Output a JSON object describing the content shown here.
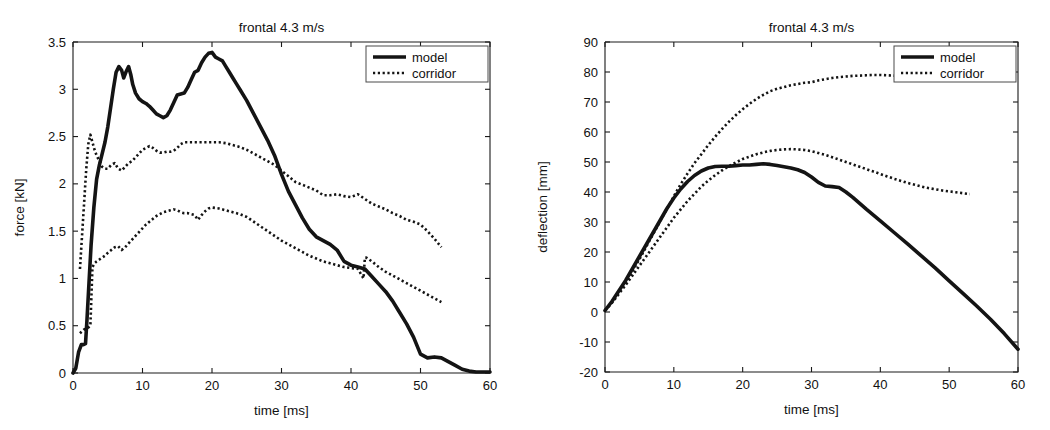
{
  "figure": {
    "background": "#ffffff",
    "line_color": "#141414",
    "panels": [
      "force-vs-time",
      "deflection-vs-time"
    ]
  },
  "chart_data": [
    {
      "id": "force-vs-time",
      "type": "line",
      "title": "frontal 4.3 m/s",
      "xlabel": "time [ms]",
      "ylabel": "force [kN]",
      "xlim": [
        0,
        60
      ],
      "ylim": [
        0,
        3.5
      ],
      "xticks": [
        0,
        10,
        20,
        30,
        40,
        50,
        60
      ],
      "xticklabels": [
        "0",
        "10",
        "20",
        "30",
        "40",
        "50",
        "60"
      ],
      "yticks": [
        0,
        0.5,
        1,
        1.5,
        2,
        2.5,
        3,
        3.5
      ],
      "yticklabels": [
        "0",
        "0.5",
        "1",
        "1.5",
        "2",
        "2.5",
        "3",
        "3.5"
      ],
      "grid": false,
      "legend": {
        "position": "upper right",
        "entries": [
          {
            "label": "model",
            "style": "solid"
          },
          {
            "label": "corridor",
            "style": "dotted"
          }
        ]
      },
      "series": [
        {
          "name": "model",
          "style": "solid",
          "x": [
            0,
            0.4,
            0.8,
            1.0,
            1.2,
            1.5,
            1.8,
            2.0,
            2.3,
            2.6,
            3.0,
            3.4,
            3.8,
            4.2,
            4.6,
            5.0,
            5.4,
            5.8,
            6.2,
            6.6,
            7.0,
            7.3,
            7.6,
            8.0,
            8.3,
            8.6,
            9.0,
            9.5,
            10.0,
            10.5,
            11.0,
            11.5,
            12.0,
            12.5,
            13.0,
            13.5,
            14.0,
            14.5,
            15.0,
            15.5,
            16.0,
            16.5,
            17.0,
            17.5,
            18.0,
            18.5,
            19.0,
            19.5,
            20.0,
            20.5,
            21.0,
            21.5,
            22.0,
            22.5,
            23.0,
            23.5,
            24.0,
            25.0,
            26.0,
            27.0,
            28.0,
            29.0,
            30.0,
            31.0,
            32.0,
            33.0,
            34.0,
            35.0,
            36.0,
            37.0,
            38.0,
            39.0,
            40.0,
            41.0,
            42.0,
            43.0,
            44.0,
            45.0,
            46.0,
            47.0,
            48.0,
            49.0,
            50.0,
            51.0,
            52.0,
            53.0,
            54.0,
            55.0,
            56.0,
            57.0,
            58.0,
            59.0,
            60.0
          ],
          "y": [
            0.0,
            0.05,
            0.22,
            0.26,
            0.3,
            0.3,
            0.31,
            0.55,
            0.95,
            1.35,
            1.75,
            2.05,
            2.2,
            2.32,
            2.44,
            2.6,
            2.8,
            3.0,
            3.18,
            3.24,
            3.2,
            3.12,
            3.18,
            3.24,
            3.16,
            3.05,
            2.96,
            2.9,
            2.87,
            2.85,
            2.82,
            2.78,
            2.74,
            2.72,
            2.7,
            2.72,
            2.78,
            2.86,
            2.94,
            2.95,
            2.96,
            3.02,
            3.1,
            3.18,
            3.2,
            3.28,
            3.34,
            3.38,
            3.39,
            3.34,
            3.32,
            3.3,
            3.24,
            3.18,
            3.12,
            3.06,
            3.0,
            2.88,
            2.74,
            2.6,
            2.46,
            2.3,
            2.1,
            1.92,
            1.78,
            1.64,
            1.52,
            1.44,
            1.4,
            1.36,
            1.3,
            1.18,
            1.14,
            1.12,
            1.1,
            1.02,
            0.94,
            0.86,
            0.76,
            0.64,
            0.52,
            0.38,
            0.2,
            0.16,
            0.17,
            0.16,
            0.12,
            0.08,
            0.04,
            0.02,
            0.01,
            0.01,
            0.01
          ]
        },
        {
          "name": "corridor_upper",
          "style": "dotted",
          "x": [
            1.0,
            1.3,
            1.6,
            1.9,
            2.2,
            2.5,
            2.8,
            3.1,
            3.4,
            3.8,
            4.2,
            4.6,
            5.0,
            5.5,
            6.0,
            6.5,
            7.0,
            7.5,
            8.0,
            8.5,
            9.0,
            9.5,
            10.0,
            10.5,
            11.0,
            11.5,
            12.0,
            12.5,
            13.0,
            13.5,
            14.0,
            14.5,
            15.0,
            15.5,
            16.0,
            17.0,
            18.0,
            19.0,
            20.0,
            21.0,
            22.0,
            23.0,
            24.0,
            25.0,
            26.0,
            27.0,
            28.0,
            29.0,
            30.0,
            31.0,
            32.0,
            33.0,
            34.0,
            35.0,
            36.0,
            37.0,
            38.0,
            39.0,
            40.0,
            41.0,
            42.0,
            43.0,
            44.0,
            45.0,
            46.0,
            47.0,
            48.0,
            49.0,
            50.0,
            51.0,
            52.0,
            53.0
          ],
          "y": [
            1.1,
            1.45,
            1.8,
            2.15,
            2.42,
            2.52,
            2.44,
            2.36,
            2.3,
            2.24,
            2.18,
            2.16,
            2.16,
            2.2,
            2.22,
            2.16,
            2.14,
            2.18,
            2.22,
            2.24,
            2.28,
            2.32,
            2.36,
            2.38,
            2.4,
            2.38,
            2.35,
            2.33,
            2.33,
            2.34,
            2.34,
            2.35,
            2.38,
            2.42,
            2.44,
            2.44,
            2.44,
            2.44,
            2.44,
            2.44,
            2.43,
            2.41,
            2.39,
            2.36,
            2.32,
            2.28,
            2.24,
            2.2,
            2.14,
            2.08,
            2.02,
            1.99,
            1.96,
            1.93,
            1.88,
            1.88,
            1.89,
            1.87,
            1.86,
            1.89,
            1.84,
            1.79,
            1.76,
            1.73,
            1.69,
            1.66,
            1.62,
            1.6,
            1.57,
            1.5,
            1.42,
            1.33
          ]
        },
        {
          "name": "corridor_lower",
          "style": "dotted",
          "x": [
            1.0,
            1.3,
            1.6,
            1.9,
            2.2,
            2.5,
            2.8,
            3.1,
            3.4,
            3.8,
            4.2,
            4.6,
            5.0,
            5.5,
            6.0,
            6.5,
            7.0,
            7.5,
            8.0,
            8.5,
            9.0,
            9.5,
            10.0,
            10.5,
            11.0,
            11.5,
            12.0,
            12.5,
            13.0,
            13.5,
            14.0,
            14.5,
            15.0,
            15.5,
            16.0,
            16.5,
            17.0,
            17.5,
            18.0,
            18.5,
            19.0,
            19.5,
            20.0,
            21.0,
            22.0,
            23.0,
            24.0,
            25.0,
            26.0,
            27.0,
            28.0,
            29.0,
            30.0,
            31.0,
            32.0,
            33.0,
            34.0,
            35.0,
            36.0,
            37.0,
            38.0,
            39.0,
            40.0,
            41.0,
            41.8,
            42.0,
            42.2,
            43.0,
            44.0,
            45.0,
            46.0,
            47.0,
            48.0,
            49.0,
            50.0,
            51.0,
            52.0,
            53.0
          ],
          "y": [
            0.42,
            0.44,
            0.46,
            0.47,
            0.48,
            0.5,
            1.12,
            1.16,
            1.18,
            1.2,
            1.22,
            1.24,
            1.27,
            1.3,
            1.33,
            1.34,
            1.3,
            1.33,
            1.37,
            1.41,
            1.45,
            1.49,
            1.53,
            1.57,
            1.6,
            1.63,
            1.66,
            1.68,
            1.7,
            1.71,
            1.72,
            1.73,
            1.72,
            1.7,
            1.69,
            1.69,
            1.68,
            1.67,
            1.62,
            1.67,
            1.71,
            1.74,
            1.75,
            1.74,
            1.72,
            1.7,
            1.68,
            1.65,
            1.6,
            1.55,
            1.5,
            1.45,
            1.4,
            1.36,
            1.32,
            1.28,
            1.24,
            1.21,
            1.18,
            1.16,
            1.14,
            1.12,
            1.11,
            1.1,
            1.0,
            1.22,
            1.22,
            1.18,
            1.12,
            1.07,
            1.03,
            0.99,
            0.95,
            0.91,
            0.87,
            0.83,
            0.79,
            0.75
          ]
        }
      ]
    },
    {
      "id": "deflection-vs-time",
      "type": "line",
      "title": "frontal 4.3 m/s",
      "xlabel": "time [ms]",
      "ylabel": "deflection [mm]",
      "xlim": [
        0,
        60
      ],
      "ylim": [
        -20,
        90
      ],
      "xticks": [
        0,
        10,
        20,
        30,
        40,
        50,
        60
      ],
      "xticklabels": [
        "0",
        "10",
        "20",
        "30",
        "40",
        "50",
        "60"
      ],
      "yticks": [
        -20,
        -10,
        0,
        10,
        20,
        30,
        40,
        50,
        60,
        70,
        80,
        90
      ],
      "yticklabels": [
        "-20",
        "-10",
        "0",
        "10",
        "20",
        "30",
        "40",
        "50",
        "60",
        "70",
        "80",
        "90"
      ],
      "grid": false,
      "legend": {
        "position": "upper right",
        "entries": [
          {
            "label": "model",
            "style": "solid"
          },
          {
            "label": "corridor",
            "style": "dotted"
          }
        ]
      },
      "series": [
        {
          "name": "model",
          "style": "solid",
          "x": [
            0,
            1,
            2,
            3,
            4,
            5,
            6,
            7,
            8,
            9,
            10,
            11,
            12,
            13,
            14,
            15,
            16,
            17,
            18,
            19,
            20,
            21,
            22,
            23,
            24,
            25,
            26,
            27,
            28,
            29,
            30,
            31,
            32,
            33,
            34,
            35,
            36,
            37,
            38,
            39,
            40,
            42,
            44,
            46,
            48,
            50,
            52,
            54,
            56,
            58,
            60
          ],
          "y": [
            0.5,
            3.5,
            7.0,
            10.5,
            14.5,
            18.5,
            22.5,
            26.5,
            30.5,
            34.5,
            38.0,
            41.0,
            43.5,
            45.5,
            47.0,
            48.0,
            48.5,
            48.6,
            48.6,
            48.8,
            49.0,
            49.0,
            49.2,
            49.4,
            49.2,
            48.8,
            48.4,
            48.0,
            47.4,
            46.5,
            45.0,
            43.2,
            42.0,
            41.8,
            41.5,
            40.0,
            38.2,
            36.2,
            34.2,
            32.3,
            30.4,
            26.5,
            22.6,
            18.6,
            14.6,
            10.4,
            6.2,
            2.0,
            -2.4,
            -7.2,
            -12.4
          ]
        },
        {
          "name": "corridor_upper",
          "style": "dotted",
          "x": [
            0,
            1,
            2,
            3,
            4,
            5,
            6,
            7,
            8,
            9,
            10,
            11,
            12,
            13,
            14,
            15,
            16,
            17,
            18,
            19,
            20,
            21,
            22,
            23,
            24,
            25,
            26,
            27,
            28,
            29,
            30,
            31,
            32,
            33,
            34,
            35,
            36,
            37,
            38,
            39,
            40,
            41,
            42,
            43,
            44
          ],
          "y": [
            0.5,
            3.2,
            6.4,
            9.8,
            13.6,
            17.6,
            21.8,
            26.0,
            30.2,
            34.4,
            38.6,
            42.6,
            46.2,
            49.6,
            52.6,
            55.6,
            58.4,
            61.0,
            63.4,
            65.6,
            67.6,
            69.4,
            71.0,
            72.4,
            73.6,
            74.4,
            75.0,
            75.6,
            76.0,
            76.4,
            76.6,
            77.2,
            77.6,
            78.0,
            78.3,
            78.5,
            78.7,
            78.8,
            78.9,
            79.0,
            79.0,
            78.9,
            78.8,
            78.7,
            78.6
          ]
        },
        {
          "name": "corridor_lower",
          "style": "dotted",
          "x": [
            0,
            1,
            2,
            3,
            4,
            5,
            6,
            7,
            8,
            9,
            10,
            11,
            12,
            13,
            14,
            15,
            16,
            17,
            18,
            19,
            20,
            21,
            22,
            23,
            24,
            25,
            26,
            27,
            28,
            29,
            30,
            31,
            32,
            33,
            34,
            35,
            36,
            37,
            38,
            39,
            40,
            41,
            42,
            43,
            44,
            45,
            46,
            47,
            48,
            49,
            50,
            51,
            52,
            53
          ],
          "y": [
            0.5,
            3.0,
            6.0,
            9.0,
            12.2,
            15.4,
            18.6,
            21.8,
            25.0,
            28.2,
            31.4,
            34.2,
            37.0,
            39.4,
            41.8,
            43.8,
            45.6,
            47.2,
            48.6,
            49.8,
            51.0,
            51.8,
            52.6,
            53.2,
            53.7,
            54.0,
            54.2,
            54.3,
            54.2,
            54.0,
            53.6,
            53.0,
            52.4,
            51.6,
            50.8,
            50.0,
            49.2,
            48.4,
            47.6,
            46.8,
            46.0,
            45.2,
            44.4,
            43.7,
            43.0,
            42.4,
            41.8,
            41.3,
            40.9,
            40.5,
            40.2,
            39.9,
            39.6,
            39.3
          ]
        }
      ]
    }
  ]
}
